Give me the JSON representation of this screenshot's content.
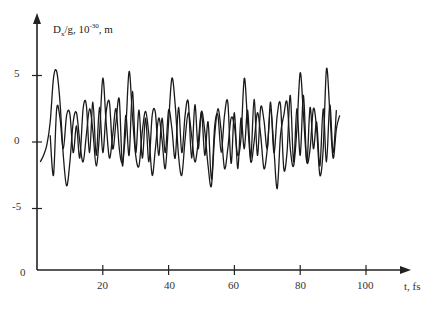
{
  "chart_data": {
    "type": "line",
    "title": "",
    "ylabel": "D_x/g, 10^-30, m",
    "ylabel_parts": {
      "main": "D",
      "sub": "x",
      "mid": "/g, 10",
      "sup": "-30",
      "tail": ", m"
    },
    "xlabel": "t, fs",
    "x_ticks": [
      20,
      40,
      60,
      80,
      100
    ],
    "x_tick_labels": [
      "20",
      "40",
      "60",
      "80",
      "100"
    ],
    "y_ticks": [
      5,
      0,
      -5
    ],
    "y_tick_labels": [
      "5",
      "0",
      "-5"
    ],
    "y_axis_bottom_label": "0",
    "xlim": [
      0,
      113
    ],
    "ylim": [
      -9.6,
      9.5
    ],
    "grid": false,
    "legend": null,
    "series": [
      {
        "name": "series-1",
        "x": [
          1,
          2,
          3,
          4,
          5,
          6,
          7,
          8,
          9,
          10,
          11,
          12,
          13,
          14,
          15,
          16,
          17,
          18,
          19,
          20,
          21,
          22,
          23,
          24,
          25,
          26,
          27,
          28,
          29,
          30,
          31,
          32,
          33,
          34,
          35,
          36,
          37,
          38,
          39,
          40,
          41,
          42,
          43,
          44,
          45,
          46,
          47,
          48,
          49,
          50,
          51,
          52,
          53,
          54,
          55,
          56,
          57,
          58,
          59,
          60,
          61,
          62,
          63,
          64,
          65,
          66,
          67,
          68,
          69,
          70,
          71,
          72,
          73,
          74,
          75,
          76,
          77,
          78,
          79,
          80,
          81,
          82,
          83,
          84,
          85,
          86,
          87,
          88,
          89,
          90,
          91,
          92
        ],
        "values": [
          -1.5,
          -1.0,
          -0.2,
          1.5,
          4.8,
          5.3,
          3.0,
          -1.0,
          -3.3,
          -1.5,
          1.5,
          2.2,
          0.0,
          -1.5,
          0.5,
          2.5,
          0.8,
          -1.8,
          0.6,
          4.8,
          1.5,
          -1.2,
          0.5,
          2.5,
          -0.5,
          -1.5,
          1.0,
          5.3,
          2.0,
          -1.0,
          -1.8,
          0.8,
          2.3,
          0.5,
          -2.5,
          -0.5,
          1.8,
          0.2,
          -2.0,
          1.5,
          4.8,
          2.8,
          -1.0,
          -2.5,
          0.2,
          2.2,
          0.5,
          -1.5,
          0.0,
          2.3,
          0.8,
          -1.8,
          -3.3,
          0.5,
          2.5,
          0.8,
          -2.0,
          -0.5,
          1.8,
          1.2,
          -1.0,
          0.3,
          4.8,
          1.5,
          -1.5,
          0.0,
          2.2,
          0.5,
          -2.0,
          -0.5,
          2.5,
          -0.5,
          -3.5,
          0.5,
          2.0,
          3.0,
          -0.5,
          -1.8,
          1.0,
          5.2,
          2.0,
          -1.5,
          -0.5,
          2.5,
          1.0,
          -2.5,
          -0.5,
          5.5,
          2.3,
          -1.2,
          1.0,
          2.0
        ]
      },
      {
        "name": "series-2",
        "x": [
          4,
          5,
          6,
          7,
          8,
          9,
          10,
          11,
          12,
          13,
          14,
          15,
          16,
          17,
          18,
          19,
          20,
          21,
          22,
          23,
          24,
          25,
          26,
          27,
          28,
          29,
          30,
          31,
          32,
          33,
          34,
          35,
          36,
          37,
          38,
          39,
          40,
          41,
          42,
          43,
          44,
          45,
          46,
          47,
          48,
          49,
          50,
          51,
          52,
          53,
          54,
          55,
          56,
          57,
          58,
          59,
          60,
          61,
          62,
          63,
          64,
          65,
          66,
          67,
          68,
          69,
          70,
          71,
          72,
          73,
          74,
          75,
          76,
          77,
          78,
          79,
          80,
          81,
          82,
          83,
          84,
          85,
          86,
          87,
          88,
          89,
          90,
          91
        ],
        "values": [
          0.5,
          -2.5,
          2.5,
          1.8,
          -0.5,
          2.0,
          2.1,
          -0.8,
          1.2,
          -1.2,
          2.5,
          2.8,
          -0.8,
          3.0,
          -1.0,
          2.6,
          -0.8,
          2.2,
          3.0,
          -0.5,
          1.5,
          3.2,
          -1.8,
          2.0,
          -1.0,
          3.8,
          -0.8,
          2.4,
          -1.2,
          1.8,
          -1.5,
          2.0,
          2.2,
          -1.0,
          1.8,
          -0.8,
          2.4,
          1.0,
          -1.2,
          2.6,
          -0.8,
          2.0,
          3.0,
          -1.2,
          2.8,
          -0.5,
          2.2,
          -1.0,
          1.5,
          -2.8,
          1.2,
          2.0,
          -0.8,
          2.0,
          3.0,
          -1.6,
          2.2,
          -2.0,
          1.8,
          -0.5,
          2.4,
          -1.2,
          3.2,
          -1.0,
          2.6,
          1.6,
          -0.5,
          3.0,
          -0.8,
          2.0,
          2.8,
          -2.0,
          -0.8,
          3.5,
          -1.5,
          2.5,
          -1.0,
          3.5,
          -1.5,
          2.6,
          -0.5,
          1.5,
          -1.8,
          2.5,
          -1.5,
          2.8,
          -0.8,
          2.4
        ]
      }
    ]
  },
  "axes": {
    "y_label": {
      "main": "D",
      "sub": "x",
      "mid": "/g, 10",
      "sup": "-30",
      "tail": ", m"
    },
    "x_label": "t, fs",
    "y_ticks": [
      "5",
      "0",
      "-5"
    ],
    "y_origin": "0",
    "x_ticks": [
      "20",
      "40",
      "60",
      "80",
      "100"
    ]
  }
}
